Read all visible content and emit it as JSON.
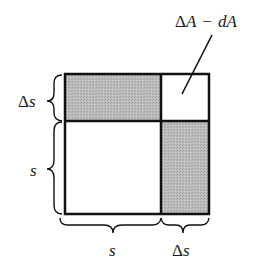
{
  "figure": {
    "annotation": {
      "delta": "Δ",
      "A1": "A",
      "minus": "−",
      "dA": "dA",
      "full": "ΔA − dA"
    },
    "left_labels": [
      {
        "delta": "Δ",
        "var": "s",
        "full": "Δs"
      },
      {
        "delta": "",
        "var": "s",
        "full": "s"
      }
    ],
    "bottom_labels": [
      {
        "delta": "",
        "var": "s",
        "full": "s"
      },
      {
        "delta": "Δ",
        "var": "s",
        "full": "Δs"
      }
    ],
    "regions": [
      {
        "name": "top-strip",
        "shaded": true
      },
      {
        "name": "corner-square",
        "shaded": false
      },
      {
        "name": "main-square",
        "shaded": false
      },
      {
        "name": "right-strip",
        "shaded": true
      }
    ],
    "colors": {
      "shade": "#b8b8b8",
      "stroke": "#111111",
      "background": "#ffffff"
    }
  }
}
